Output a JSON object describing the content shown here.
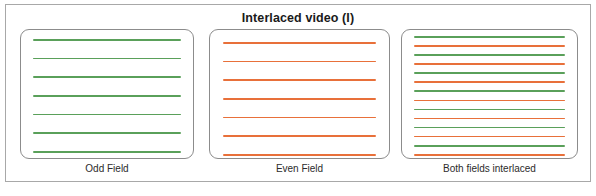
{
  "figure": {
    "title": "Interlaced video (I)",
    "border_color": "#a8a8a8",
    "background": "#ffffff"
  },
  "colors": {
    "green_line": "#5aa05a",
    "orange_line": "#e8703a",
    "panel_border": "#8c8c8c",
    "title_text": "#1a1a1a",
    "caption_text": "#2b2b2b"
  },
  "panels": [
    {
      "caption": "Odd Field",
      "line_count": 7,
      "line_colors": [
        "green",
        "green",
        "green",
        "green",
        "green",
        "green",
        "green"
      ]
    },
    {
      "caption": "Even Field",
      "line_count": 7,
      "line_colors": [
        "orange",
        "orange",
        "orange",
        "orange",
        "orange",
        "orange",
        "orange"
      ]
    },
    {
      "caption": "Both fields interlaced",
      "line_count": 14,
      "line_colors": [
        "green",
        "orange",
        "green",
        "orange",
        "green",
        "orange",
        "green",
        "orange",
        "green",
        "orange",
        "green",
        "orange",
        "green",
        "orange"
      ]
    }
  ]
}
